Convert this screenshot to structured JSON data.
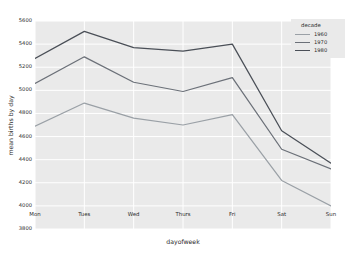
{
  "chart_data": {
    "type": "line",
    "title": "",
    "xlabel": "dayofweek",
    "ylabel": "mean births by day",
    "categories": [
      "Mon",
      "Tues",
      "Wed",
      "Thurs",
      "Fri",
      "Sat",
      "Sun"
    ],
    "ylim": [
      3800,
      5600
    ],
    "yticks": [
      3800,
      4000,
      4200,
      4400,
      4600,
      4800,
      5000,
      5200,
      5400,
      5600
    ],
    "grid": true,
    "legend": {
      "title": "decade",
      "position": "upper right",
      "entries": [
        "1960",
        "1970",
        "1980"
      ]
    },
    "series": [
      {
        "name": "1960",
        "color": "#9aa0a6",
        "values": [
          4690,
          4890,
          4760,
          4700,
          4790,
          4220,
          4000
        ]
      },
      {
        "name": "1970",
        "color": "#6b7078",
        "values": [
          5060,
          5290,
          5070,
          4990,
          5110,
          4490,
          4320
        ]
      },
      {
        "name": "1980",
        "color": "#4a4f57",
        "values": [
          5275,
          5510,
          5370,
          5340,
          5400,
          4650,
          4370
        ]
      }
    ],
    "style": {
      "axes_background": "#eaeaea",
      "grid_color": "#ffffff",
      "figure_background": "#ffffff",
      "text_color": "#2b2b2b"
    }
  }
}
